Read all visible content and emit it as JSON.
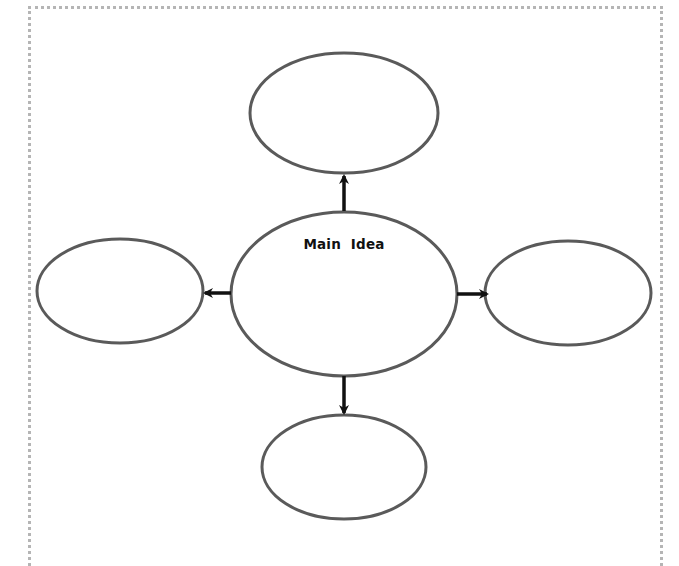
{
  "diagram": {
    "type": "concept-map",
    "center": {
      "label": "Main  Idea",
      "text": ""
    },
    "branches": [
      {
        "position": "top",
        "text": ""
      },
      {
        "position": "left",
        "text": ""
      },
      {
        "position": "right",
        "text": ""
      },
      {
        "position": "bottom",
        "text": ""
      }
    ],
    "colors": {
      "ellipse_stroke": "#5a5a5a",
      "arrow": "#111111",
      "frame_dots": "#b5b5b5",
      "background": "#ffffff"
    }
  }
}
